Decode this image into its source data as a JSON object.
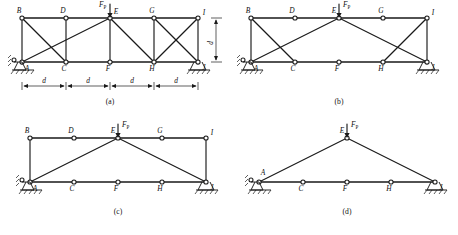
{
  "figure": {
    "title_caption": "",
    "panels": [
      {
        "id": "a",
        "caption": "(a)",
        "load_label": "F",
        "load_subscript": "P",
        "span_dim_label": "d",
        "height_dim_label": "d",
        "span_count": 4,
        "node_labels": {
          "A": "A",
          "B": "B",
          "C": "C",
          "D": "D",
          "E": "E",
          "F": "F",
          "G": "G",
          "H": "H",
          "I": "I",
          "J": "J"
        },
        "description": "Fully braced truss: verticals at all panel points, crossing diagonals in end bays, single diagonals in middle bays",
        "members": [
          "B-D",
          "D-E",
          "E-G",
          "G-I",
          "A-C",
          "C-F",
          "F-H",
          "H-J",
          "A-B",
          "C-D",
          "F-E",
          "H-G",
          "J-I",
          "B-C",
          "A-E",
          "C-E",
          "E-H",
          "G-J",
          "H-I"
        ],
        "support_left": "pin",
        "support_right": "roller"
      },
      {
        "id": "b",
        "caption": "(b)",
        "load_label": "F",
        "load_subscript": "P",
        "node_labels": {
          "A": "A",
          "B": "B",
          "C": "C",
          "D": "D",
          "E": "E",
          "F": "F",
          "G": "G",
          "H": "H",
          "I": "I",
          "J": "J"
        },
        "description": "Intermediate verticals removed; crossing diagonals retained in end bays",
        "members": [
          "B-D",
          "D-E",
          "E-G",
          "G-I",
          "A-C",
          "C-F",
          "F-H",
          "H-J",
          "A-B",
          "J-I",
          "B-C",
          "A-E",
          "E-J",
          "H-I"
        ],
        "support_left": "pin",
        "support_right": "roller"
      },
      {
        "id": "c",
        "caption": "(c)",
        "load_label": "F",
        "load_subscript": "P",
        "node_labels": {
          "A": "A",
          "B": "B",
          "C": "C",
          "D": "D",
          "E": "E",
          "F": "F",
          "G": "G",
          "H": "H",
          "I": "I",
          "J": "J"
        },
        "description": "Only end verticals and the two main diagonals A-E and E-J remain",
        "members": [
          "B-D",
          "D-E",
          "E-G",
          "G-I",
          "A-C",
          "C-F",
          "F-H",
          "H-J",
          "A-B",
          "J-I",
          "A-E",
          "E-J"
        ],
        "support_left": "pin",
        "support_right": "roller"
      },
      {
        "id": "d",
        "caption": "(d)",
        "load_label": "F",
        "load_subscript": "P",
        "node_labels": {
          "A": "A",
          "C": "C",
          "E": "E",
          "F": "F",
          "H": "H",
          "J": "J"
        },
        "description": "Reduced triangular truss: bottom chord A-C-F-H-J with apex E",
        "members": [
          "A-C",
          "C-F",
          "F-H",
          "H-J",
          "A-E",
          "E-J"
        ],
        "support_left": "pin",
        "support_right": "roller"
      }
    ]
  }
}
